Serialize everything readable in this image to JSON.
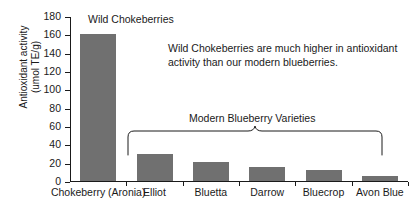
{
  "chart_data": {
    "type": "bar",
    "title": "",
    "xlabel": "",
    "ylabel": "Antioxidant activity (umol TE/g)",
    "ylabel_line1": "Antioxidant activity",
    "ylabel_line2": "(umol TE/g)",
    "ylim": [
      0,
      180
    ],
    "ytick_step": 20,
    "yticks": [
      0,
      20,
      40,
      60,
      80,
      100,
      120,
      140,
      160,
      180
    ],
    "categories": [
      "Chokeberry (Aronia)",
      "Elliot",
      "Bluetta",
      "Darrow",
      "Bluecrop",
      "Avon Blue"
    ],
    "values": [
      160,
      30,
      21,
      15,
      12,
      5
    ],
    "grid": false,
    "legend": "none",
    "bar_color": "#707070",
    "axis_color": "#1a1a1a",
    "annotations": {
      "bar_label": "Wild Chokeberries",
      "paragraph": "Wild Chokeberries are much higher in antioxidant activity than our modern blueberries.",
      "group_label": "Modern Blueberry Varieties",
      "group_members": [
        "Elliot",
        "Bluetta",
        "Darrow",
        "Bluecrop",
        "Avon Blue"
      ]
    }
  }
}
